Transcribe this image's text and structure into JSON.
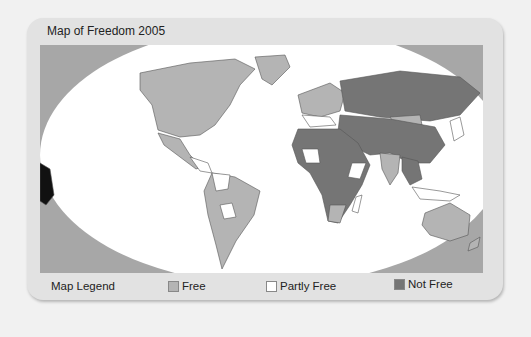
{
  "title": "Map of Freedom 2005",
  "legend": {
    "heading": "Map Legend",
    "items": [
      {
        "label": "Free",
        "color": "#b4b4b4"
      },
      {
        "label": "Partly Free",
        "color": "#ffffff"
      },
      {
        "label": "Not Free",
        "color": "#757575"
      }
    ]
  },
  "colors": {
    "background": "#f1f1f1",
    "panel": "#e2e2e2",
    "map_frame": "#a7a7a7",
    "ocean": "#ffffff",
    "free": "#b4b4b4",
    "partly_free": "#ffffff",
    "not_free": "#757575"
  }
}
